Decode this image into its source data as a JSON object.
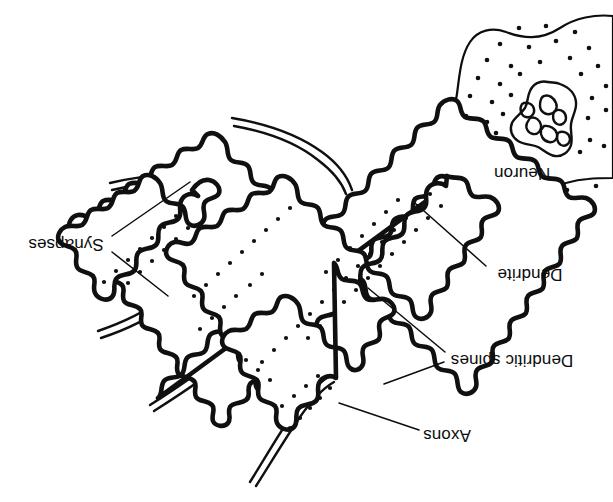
{
  "figure": {
    "orientation": "rotated-180",
    "background_color": "#ffffff",
    "ink_color": "#101010",
    "width": 613,
    "height": 502
  },
  "labels": {
    "synapses": "Synapses",
    "neuron": "Neuron",
    "dendrite": "Dendrite",
    "dendritic_spines": "Dendritic spines",
    "axons": "Axons"
  },
  "annotations": [
    {
      "id": "synapses",
      "text": "Synapses",
      "x": 66,
      "y": 243,
      "anchor": "middle",
      "leaders": 2
    },
    {
      "id": "neuron",
      "text": "Neuron",
      "x": 522,
      "y": 172,
      "anchor": "middle",
      "leaders": 0
    },
    {
      "id": "dendrite",
      "text": "Dendrite",
      "x": 530,
      "y": 273,
      "anchor": "middle",
      "leaders": 1
    },
    {
      "id": "dendritic-spines",
      "text": "Dendritic spines",
      "x": 512,
      "y": 359,
      "anchor": "middle",
      "leaders": 2
    },
    {
      "id": "axons",
      "text": "Axons",
      "x": 447,
      "y": 434,
      "anchor": "middle",
      "leaders": 1
    }
  ],
  "parts": {
    "soma_label": "Neuron cell body",
    "nucleus_label": "Nucleus",
    "dendrite_label": "Dendrite shaft",
    "spines_label": "Dendritic spines",
    "axon_count": 5,
    "axon_label": "Axon"
  }
}
